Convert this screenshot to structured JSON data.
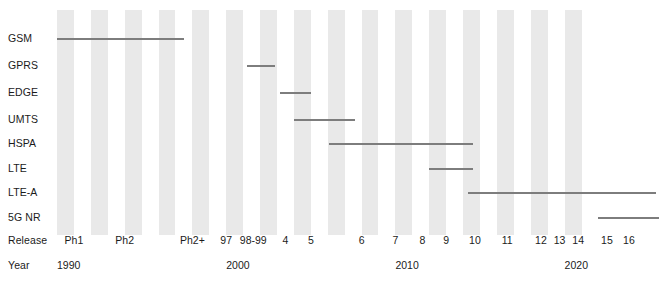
{
  "chart_data": {
    "type": "bar",
    "orientation": "horizontal-timeline",
    "title": "",
    "xlabel": "Year",
    "ylabel": "",
    "xlim": [
      1990,
      2021.5
    ],
    "grid": "alternating-year-stripes",
    "legend": "none",
    "row_axis_label": "Release",
    "year_axis_label": "Year",
    "categories": [
      "GSM",
      "GPRS",
      "EDGE",
      "UMTS",
      "HSPA",
      "LTE",
      "LTE-A",
      "5G NR"
    ],
    "year_ticks": [
      {
        "label": "1990",
        "year": 1990
      },
      {
        "label": "2000",
        "year": 2000
      },
      {
        "label": "2010",
        "year": 2010
      },
      {
        "label": "2020",
        "year": 2020
      }
    ],
    "releases": [
      {
        "label": "Ph1",
        "year": 1991.0
      },
      {
        "label": "Ph2",
        "year": 1994.0
      },
      {
        "label": "Ph2+",
        "year": 1998.0
      },
      {
        "label": "97",
        "year": 2000.0
      },
      {
        "label": "98-99",
        "year": 2001.6
      },
      {
        "label": "4",
        "year": 2003.5
      },
      {
        "label": "5",
        "year": 2005.0
      },
      {
        "label": "6",
        "year": 2008.0
      },
      {
        "label": "7",
        "year": 2010.0
      },
      {
        "label": "8",
        "year": 2011.6
      },
      {
        "label": "9",
        "year": 2013.0
      },
      {
        "label": "10",
        "year": 2014.7
      },
      {
        "label": "11",
        "year": 2016.6
      },
      {
        "label": "12",
        "year": 2018.6
      },
      {
        "label": "13",
        "year": 2019.7
      },
      {
        "label": "14",
        "year": 2020.8
      },
      {
        "label": "15",
        "year": 2022.5
      },
      {
        "label": "16",
        "year": 2023.8
      }
    ],
    "series": [
      {
        "name": "GSM",
        "start": 1990.0,
        "end": 1997.5
      },
      {
        "name": "GPRS",
        "start": 2001.2,
        "end": 2002.9
      },
      {
        "name": "EDGE",
        "start": 2003.2,
        "end": 2005.0
      },
      {
        "name": "UMTS",
        "start": 2004.0,
        "end": 2007.6
      },
      {
        "name": "HSPA",
        "start": 2006.1,
        "end": 2014.6
      },
      {
        "name": "LTE",
        "start": 2012.0,
        "end": 2014.6
      },
      {
        "name": "LTE-A",
        "start": 2014.3,
        "end": 2025.4
      },
      {
        "name": "5G NR",
        "start": 2022.0,
        "end": 2025.6
      }
    ]
  },
  "rows": [
    {
      "label": "GSM"
    },
    {
      "label": "GPRS"
    },
    {
      "label": "EDGE"
    },
    {
      "label": "UMTS"
    },
    {
      "label": "HSPA"
    },
    {
      "label": "LTE"
    },
    {
      "label": "LTE-A"
    },
    {
      "label": "5G NR"
    }
  ],
  "axis": {
    "release_label": "Release",
    "year_label": "Year"
  },
  "colors": {
    "background": "#ffffff",
    "stripe": "#e9e9e9",
    "bar": "#7d7d7d",
    "text": "#1b1b1b"
  },
  "geometry": {
    "plot_left": 57,
    "plot_width": 533,
    "plot_top": 10,
    "plot_height": 225,
    "year_min": 1990,
    "year_max": 2021.5,
    "row_y": [
      38,
      65,
      92,
      119,
      143,
      168,
      192,
      217
    ],
    "release_row_y": 240,
    "year_row_y": 265
  }
}
